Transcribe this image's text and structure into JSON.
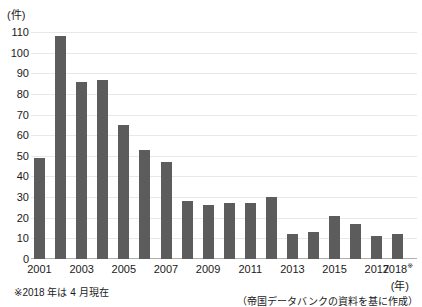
{
  "chart_data": {
    "type": "bar",
    "unit_label": "(件)",
    "x_axis_unit_label": "(年)",
    "categories": [
      "2001",
      "2002",
      "2003",
      "2004",
      "2005",
      "2006",
      "2007",
      "2008",
      "2009",
      "2010",
      "2011",
      "2012",
      "2013",
      "2014",
      "2015",
      "2016",
      "2017",
      "2018"
    ],
    "values": [
      49,
      108,
      86,
      87,
      65,
      53,
      47,
      28,
      26,
      27,
      27,
      30,
      12,
      13,
      21,
      17,
      11,
      12
    ],
    "x_ticks": [
      {
        "index": 0,
        "label": "2001"
      },
      {
        "index": 2,
        "label": "2003"
      },
      {
        "index": 4,
        "label": "2005"
      },
      {
        "index": 6,
        "label": "2007"
      },
      {
        "index": 8,
        "label": "2009"
      },
      {
        "index": 10,
        "label": "2011"
      },
      {
        "index": 12,
        "label": "2013"
      },
      {
        "index": 14,
        "label": "2015"
      },
      {
        "index": 16,
        "label": "2017"
      },
      {
        "index": 17,
        "label": "2018※"
      }
    ],
    "ylim": [
      0,
      110
    ],
    "ytick_step": 10,
    "grid": true,
    "legend_position": "none",
    "bar_color": "#5c5c5c",
    "gridline_color": "#e8e8e8",
    "axis_color": "#b0b0b0",
    "text_color": "#1a1a1a",
    "footnotes": {
      "left": "※2018 年は 4 月現在",
      "right": "（帝国データバンクの資料を基に作成）"
    }
  }
}
